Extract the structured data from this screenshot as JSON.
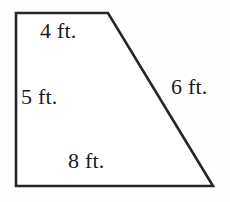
{
  "figure": {
    "kind": "trapezoid-diagram",
    "stroke_color": "#262626",
    "fill_color": "#ffffff",
    "background_color": "#fefefe",
    "stroke_width": 2.6,
    "unit": "ft.",
    "vertices": [
      {
        "name": "top-left",
        "x": 16,
        "y": 13
      },
      {
        "name": "top-right",
        "x": 108,
        "y": 13
      },
      {
        "name": "bottom-right",
        "x": 213,
        "y": 186
      },
      {
        "name": "bottom-left",
        "x": 16,
        "y": 186
      }
    ],
    "polygon_points": "16,13 108,13 213,186 16,186",
    "sides": {
      "top": {
        "label": "4 ft.",
        "value": 4,
        "unit": "ft."
      },
      "left": {
        "label": "5 ft.",
        "value": 5,
        "unit": "ft."
      },
      "right": {
        "label": "6 ft.",
        "value": 6,
        "unit": "ft."
      },
      "bottom": {
        "label": "8 ft.",
        "value": 8,
        "unit": "ft."
      }
    }
  }
}
